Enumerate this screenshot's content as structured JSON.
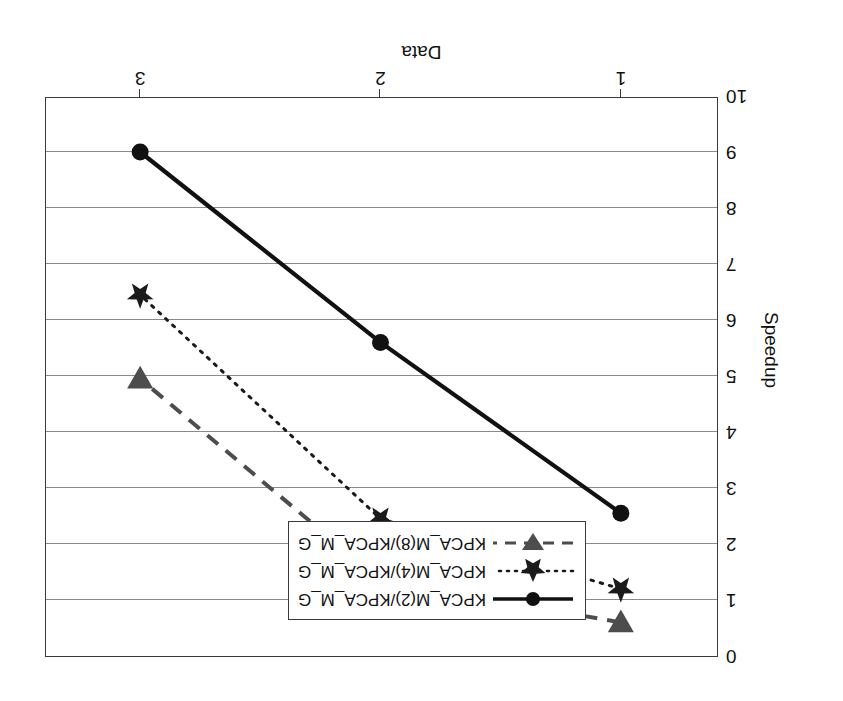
{
  "chart_data": {
    "type": "line",
    "title": "",
    "xlabel": "Data",
    "ylabel": "Speedup",
    "x": [
      1,
      2,
      3
    ],
    "xtick_labels": [
      "1",
      "2",
      "3"
    ],
    "xlim": [
      0.6,
      3.4
    ],
    "ylim": [
      0,
      10
    ],
    "y_inverted": true,
    "ytick_labels": [
      "0",
      "1",
      "2",
      "3",
      "4",
      "5",
      "6",
      "7",
      "8",
      "9",
      "10"
    ],
    "ytick_values": [
      0,
      1,
      2,
      3,
      4,
      5,
      6,
      7,
      8,
      9,
      10
    ],
    "grid": "horizontal",
    "legend_position": "inside-lower-center",
    "rotation_degrees": 180,
    "series": [
      {
        "name": "KPCA_M(2)/KPCA_M_G",
        "values": [
          2.55,
          5.6,
          9.0
        ],
        "marker": "circle",
        "linestyle": "solid",
        "color": "#111111"
      },
      {
        "name": "KPCA_M(4)/KPCA_M_G",
        "values": [
          1.2,
          2.45,
          6.45
        ],
        "marker": "star",
        "linestyle": "dotted",
        "color": "#1a1a1a"
      },
      {
        "name": "KPCA_M(8)/KPCA_M_G",
        "values": [
          0.6,
          1.35,
          4.95
        ],
        "marker": "triangle-down",
        "linestyle": "dashed",
        "color": "#4d4d4d"
      }
    ]
  },
  "axes": {
    "y_title": "Speedup",
    "x_title": "Data"
  },
  "legend": {
    "items": [
      {
        "label": "KPCA_M(2)/KPCA_M_G"
      },
      {
        "label": "KPCA_M(4)/KPCA_M_G"
      },
      {
        "label": "KPCA_M(8)/KPCA_M_G"
      }
    ]
  }
}
